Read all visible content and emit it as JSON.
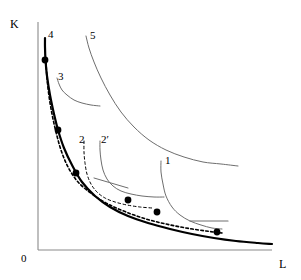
{
  "figure": {
    "type": "isoquant-expansion-path-diagram",
    "background_color": "#ffffff",
    "width": 301,
    "height": 280
  },
  "axes": {
    "y_label": "K",
    "x_label": "L",
    "origin_label": "0",
    "color": "#808080",
    "x_axis": {
      "x1": 38,
      "y1": 250,
      "x2": 272,
      "y2": 250
    },
    "y_axis": {
      "x1": 38,
      "y1": 22,
      "x2": 38,
      "y2": 250
    }
  },
  "curve_labels": [
    {
      "id": "1",
      "text": "1",
      "x": 165,
      "y": 155
    },
    {
      "id": "2",
      "text": "2",
      "x": 79,
      "y": 134
    },
    {
      "id": "2p",
      "text": "2′",
      "x": 101,
      "y": 134
    },
    {
      "id": "3",
      "text": "3",
      "x": 58,
      "y": 71
    },
    {
      "id": "4",
      "text": "4",
      "x": 48,
      "y": 29
    },
    {
      "id": "5",
      "text": "5",
      "x": 90,
      "y": 30
    }
  ],
  "chart_data": {
    "type": "line",
    "title": "",
    "xlabel": "L",
    "ylabel": "K",
    "grid": false,
    "legend": "none",
    "xlim": [
      0,
      301
    ],
    "ylim": [
      280,
      0
    ],
    "series": [
      {
        "name": "expansion-path",
        "style": "solid",
        "color": "#000000",
        "width": 2.2,
        "points": [
          [
            45,
            38
          ],
          [
            45,
            47
          ],
          [
            45.5,
            60
          ],
          [
            47,
            76
          ],
          [
            50,
            95
          ],
          [
            54,
            114
          ],
          [
            58,
            130
          ],
          [
            64,
            148
          ],
          [
            72,
            165
          ],
          [
            82,
            182
          ],
          [
            95,
            196
          ],
          [
            110,
            207
          ],
          [
            128,
            216
          ],
          [
            148,
            223
          ],
          [
            170,
            229
          ],
          [
            192,
            234
          ],
          [
            214,
            238
          ],
          [
            236,
            241
          ],
          [
            258,
            243
          ],
          [
            272,
            244
          ]
        ]
      },
      {
        "name": "cost-path-dashed",
        "style": "dashed",
        "color": "#000000",
        "width": 1.6,
        "points": [
          [
            46,
            62
          ],
          [
            47,
            78
          ],
          [
            49,
            96
          ],
          [
            52,
            114
          ],
          [
            56,
            132
          ],
          [
            61,
            150
          ],
          [
            68,
            167
          ],
          [
            78,
            182
          ],
          [
            92,
            194
          ],
          [
            108,
            204
          ],
          [
            126,
            212
          ],
          [
            146,
            219
          ],
          [
            166,
            224
          ],
          [
            186,
            228
          ],
          [
            206,
            231
          ],
          [
            222,
            233
          ]
        ]
      },
      {
        "name": "isoquant-5",
        "style": "solid",
        "color": "#6e6e6e",
        "width": 1.0,
        "points": [
          [
            86,
            36
          ],
          [
            89,
            48
          ],
          [
            94,
            62
          ],
          [
            101,
            78
          ],
          [
            110,
            95
          ],
          [
            121,
            112
          ],
          [
            134,
            127
          ],
          [
            149,
            140
          ],
          [
            166,
            150
          ],
          [
            184,
            157
          ],
          [
            203,
            162
          ],
          [
            221,
            164
          ],
          [
            238,
            166
          ]
        ]
      },
      {
        "name": "isoquant-3",
        "style": "solid",
        "color": "#6e6e6e",
        "width": 1.0,
        "points": [
          [
            57,
            78
          ],
          [
            59,
            84
          ],
          [
            62,
            90
          ],
          [
            67,
            95
          ],
          [
            74,
            100
          ],
          [
            82,
            103
          ],
          [
            91,
            105
          ],
          [
            100,
            106
          ]
        ]
      },
      {
        "name": "isoquant-2prime",
        "style": "solid",
        "color": "#6e6e6e",
        "width": 1.0,
        "points": [
          [
            100,
            141
          ],
          [
            100,
            150
          ],
          [
            101,
            160
          ],
          [
            103,
            170
          ],
          [
            107,
            179
          ],
          [
            113,
            186
          ],
          [
            121,
            191
          ],
          [
            131,
            194
          ],
          [
            142,
            196
          ],
          [
            154,
            197
          ],
          [
            164,
            197
          ]
        ]
      },
      {
        "name": "isoquant-2-dashed",
        "style": "dashed",
        "color": "#000000",
        "width": 1.0,
        "points": [
          [
            84,
            141
          ],
          [
            84,
            152
          ],
          [
            85,
            163
          ],
          [
            87,
            174
          ],
          [
            91,
            184
          ],
          [
            97,
            192
          ],
          [
            105,
            198
          ],
          [
            115,
            202
          ],
          [
            127,
            205
          ],
          [
            140,
            207
          ],
          [
            152,
            208
          ]
        ]
      },
      {
        "name": "isoquant-1",
        "style": "solid",
        "color": "#6e6e6e",
        "width": 1.0,
        "points": [
          [
            161,
            161
          ],
          [
            161,
            172
          ],
          [
            163,
            184
          ],
          [
            166,
            196
          ],
          [
            172,
            207
          ],
          [
            180,
            215
          ],
          [
            190,
            221
          ],
          [
            201,
            225
          ],
          [
            212,
            228
          ],
          [
            222,
            229
          ]
        ]
      },
      {
        "name": "tangent-line-2prime",
        "style": "solid",
        "color": "#6e6e6e",
        "width": 1.0,
        "points": [
          [
            94,
            178
          ],
          [
            128,
            188
          ]
        ]
      },
      {
        "name": "tangent-line-1",
        "style": "solid",
        "color": "#6e6e6e",
        "width": 1.2,
        "points": [
          [
            190,
            221
          ],
          [
            228,
            221
          ]
        ]
      }
    ],
    "markers": {
      "name": "expansion-path-points",
      "shape": "filled-circle",
      "color": "#000000",
      "radius": 3.4,
      "points": [
        [
          45,
          60
        ],
        [
          58,
          130
        ],
        [
          76,
          173
        ],
        [
          128,
          200
        ],
        [
          157,
          212
        ],
        [
          217,
          232
        ]
      ]
    }
  }
}
